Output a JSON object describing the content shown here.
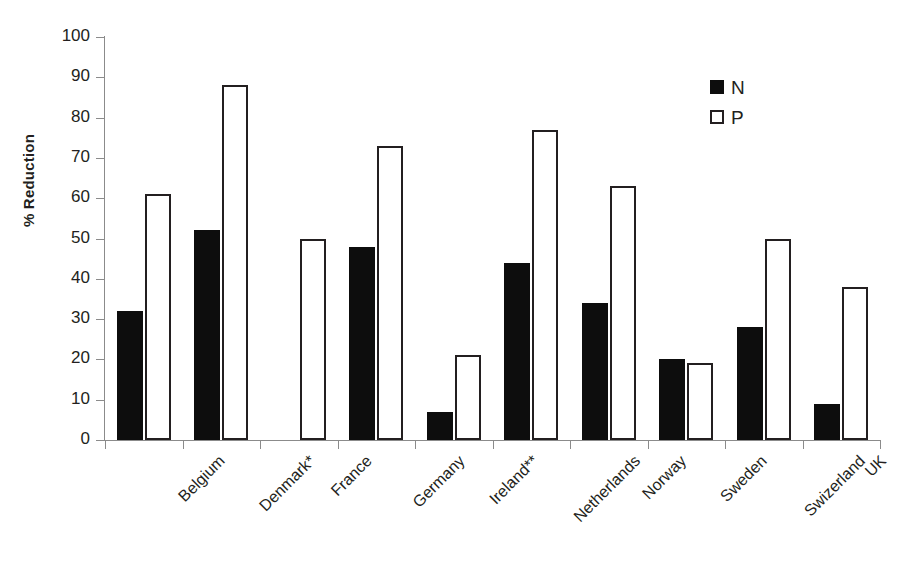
{
  "chart_data": {
    "type": "bar",
    "title": "",
    "subtitle": "",
    "xlabel": "",
    "ylabel": "% Reduction",
    "ylim": [
      0,
      100
    ],
    "ytick_step": 10,
    "ytick_labels": [
      "0",
      "10",
      "20",
      "30",
      "40",
      "50",
      "60",
      "70",
      "80",
      "90",
      "100"
    ],
    "grid": false,
    "legend_position": "top-right",
    "categories": [
      "Belgium",
      "Denmark*",
      "France",
      "Germany",
      "Ireland**",
      "Netherlands",
      "Norway",
      "Sweden",
      "Swizerland",
      "UK"
    ],
    "series": [
      {
        "name": "N",
        "color": "#0d0d0d",
        "style": "filled",
        "values": [
          32,
          52,
          null,
          48,
          7,
          44,
          34,
          20,
          28,
          9
        ]
      },
      {
        "name": "P",
        "color": "#ffffff",
        "style": "outlined",
        "values": [
          61,
          88,
          50,
          73,
          21,
          77,
          63,
          19,
          50,
          38
        ]
      }
    ]
  },
  "legend": {
    "items": [
      {
        "label": "N",
        "swatch": "filled-square"
      },
      {
        "label": "P",
        "swatch": "open-square"
      }
    ]
  },
  "axes": {
    "y_axis_title": "% Reduction"
  },
  "colors": {
    "series_n": "#0d0d0d",
    "series_p": "#ffffff",
    "outline": "#231f20",
    "axis": "#8b8b8b",
    "background": "#ffffff"
  }
}
